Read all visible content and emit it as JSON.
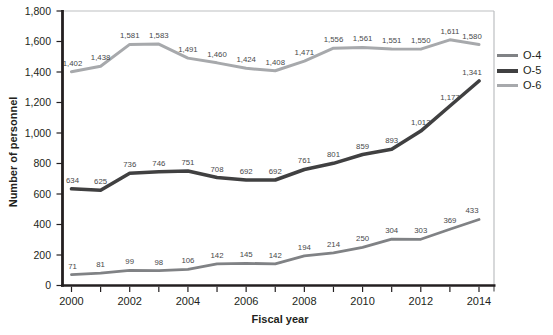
{
  "figure": {
    "y_axis_title": "Number of personnel",
    "x_axis_title": "Fiscal year"
  },
  "legend": {
    "position": "right",
    "items": [
      {
        "label": "O-4"
      },
      {
        "label": "O-5"
      },
      {
        "label": "O-6"
      }
    ]
  },
  "chart_data": {
    "type": "line",
    "title": "",
    "xlabel": "Fiscal year",
    "ylabel": "Number of personnel",
    "x": [
      2000,
      2001,
      2002,
      2003,
      2004,
      2005,
      2006,
      2007,
      2008,
      2009,
      2010,
      2011,
      2012,
      2013,
      2014
    ],
    "x_tick_labels": [
      "2000",
      "2002",
      "2004",
      "2006",
      "2008",
      "2010",
      "2012",
      "2014"
    ],
    "ylim": [
      0,
      1800
    ],
    "y_tick_step": 200,
    "grid": false,
    "data_labels": true,
    "legend_position": "right",
    "axis_color": "#231f20",
    "frame_border_color": "#bdbfc1",
    "data_label_color": "#48494b",
    "series": [
      {
        "name": "O-4",
        "color": "#808285",
        "values": [
          71,
          81,
          99,
          98,
          106,
          142,
          145,
          142,
          194,
          214,
          250,
          304,
          303,
          369,
          433
        ]
      },
      {
        "name": "O-5",
        "color": "#404041",
        "values": [
          634,
          625,
          736,
          746,
          751,
          708,
          692,
          692,
          761,
          801,
          859,
          893,
          1013,
          1177,
          1341
        ]
      },
      {
        "name": "O-6",
        "color": "#a7a9ac",
        "values": [
          1402,
          1438,
          1581,
          1583,
          1491,
          1460,
          1424,
          1408,
          1471,
          1556,
          1561,
          1551,
          1550,
          1611,
          1580
        ]
      }
    ]
  }
}
